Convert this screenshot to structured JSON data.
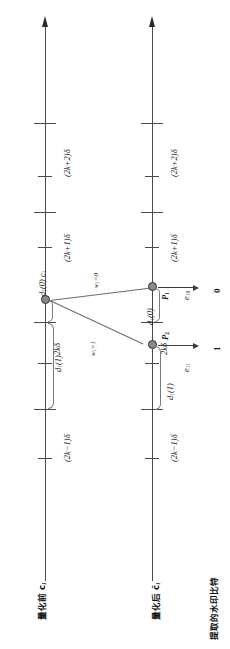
{
  "figure": {
    "orientation": "rotated-90-ccw",
    "colors": {
      "axis": "#4a4a4a",
      "marker_fill": "#8a8a8a",
      "marker_stroke": "#2e2e2e",
      "text": "#1a1a1a",
      "leader": "#6a6a6a"
    }
  },
  "row_labels": {
    "before": "量化前 c",
    "before_sub": "1",
    "after": "量化后 c̄",
    "after_sub": "1",
    "extracted": "提取的水印比特"
  },
  "axis1": {
    "name": "before-quantization-axis",
    "ticks": [
      {
        "label": "(2k+2)",
        "unit": "δ",
        "type": "major"
      },
      {
        "label": "",
        "unit": "",
        "type": "minor"
      },
      {
        "label": "(2k+1)",
        "unit": "δ",
        "type": "major"
      },
      {
        "label": "",
        "unit": "",
        "type": "minor"
      },
      {
        "label": "2k",
        "unit": "δ",
        "type": "major"
      },
      {
        "label": "",
        "unit": "",
        "type": "minor"
      },
      {
        "label": "(2k−1)",
        "unit": "δ",
        "type": "major"
      },
      {
        "label": "",
        "unit": "",
        "type": "minor"
      }
    ],
    "point_label": "c",
    "point_sub": "1",
    "dist_upper": "d",
    "dist_upper_sub": "1",
    "dist_upper_arg": "(0)",
    "dist_lower": "d",
    "dist_lower_sub": "1",
    "dist_lower_arg": "(1)",
    "mid_tick_label": "2k",
    "mid_tick_unit": "δ"
  },
  "axis2": {
    "name": "after-quantization-axis",
    "ticks": [
      {
        "label": "(2k+2)",
        "unit": "δ",
        "type": "major"
      },
      {
        "label": "",
        "unit": "",
        "type": "minor"
      },
      {
        "label": "(2k+1)",
        "unit": "δ",
        "type": "major"
      },
      {
        "label": "",
        "unit": "",
        "type": "minor"
      },
      {
        "label": "2k",
        "unit": "δ",
        "type": "major"
      },
      {
        "label": "",
        "unit": "",
        "type": "minor"
      },
      {
        "label": "(2k−1)",
        "unit": "δ",
        "type": "major"
      },
      {
        "label": "",
        "unit": "",
        "type": "minor"
      }
    ],
    "p1": "P",
    "p1_sub": "1",
    "p2": "P",
    "p2_sub": "2",
    "e10": "e",
    "e10_sub": "10",
    "e11": "e",
    "e11_sub": "11",
    "dist_p1": "d",
    "dist_p1_sub": "1",
    "dist_p1_arg": "(0)",
    "dist_p2": "d",
    "dist_p2_sub": "1",
    "dist_p2_arg": "(1)",
    "mid_tick_label": "2k",
    "mid_tick_unit": "δ"
  },
  "watermark": {
    "w_zero": "w",
    "w_zero_sub": "1",
    "w_zero_val": "=0",
    "w_one": "w",
    "w_one_sub": "1",
    "w_one_val": "=1"
  },
  "outputs": {
    "bit0": "0",
    "bit1": "1"
  }
}
